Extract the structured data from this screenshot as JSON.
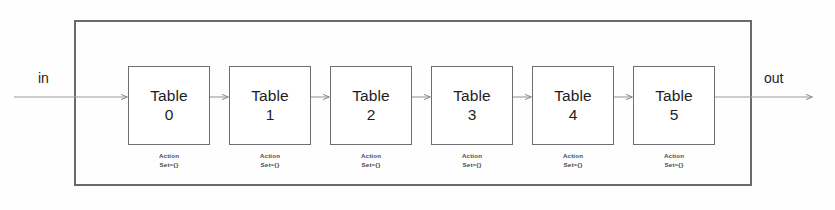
{
  "diagram": {
    "type": "pipeline-block-diagram",
    "stroke_color": "#6a6a6c",
    "text_color": "#1d1d1f",
    "background_color": "#fefeff",
    "io": {
      "input_label": "in",
      "output_label": "out"
    },
    "stages": [
      {
        "title": "Table",
        "number": "0",
        "action_line1": "Action",
        "action_line2": "Set={}"
      },
      {
        "title": "Table",
        "number": "1",
        "action_line1": "Action",
        "action_line2": "Set={}"
      },
      {
        "title": "Table",
        "number": "2",
        "action_line1": "Action",
        "action_line2": "Set={}"
      },
      {
        "title": "Table",
        "number": "3",
        "action_line1": "Action",
        "action_line2": "Set={}"
      },
      {
        "title": "Table",
        "number": "4",
        "action_line1": "Action",
        "action_line2": "Set={}"
      },
      {
        "title": "Table",
        "number": "5",
        "action_line1": "Action",
        "action_line2": "Set={}"
      }
    ]
  }
}
